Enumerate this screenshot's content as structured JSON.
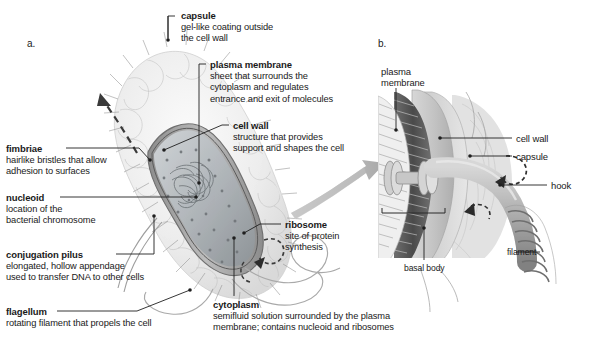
{
  "figure": {
    "panel_a_letter": "a.",
    "panel_b_letter": "b."
  },
  "panel_a": {
    "labels": [
      {
        "id": "capsule",
        "title": "capsule",
        "lines": [
          "gel-like coating outside",
          "the cell wall"
        ]
      },
      {
        "id": "plasma",
        "title": "plasma membrane",
        "lines": [
          "sheet that surrounds the",
          "cytoplasm and regulates",
          "entrance and exit of molecules"
        ]
      },
      {
        "id": "cellwall",
        "title": "cell wall",
        "lines": [
          "structure that provides",
          "support and shapes the cell"
        ]
      },
      {
        "id": "fimbriae",
        "title": "fimbriae",
        "lines": [
          "hairlike bristles that allow",
          "adhesion to surfaces"
        ]
      },
      {
        "id": "nucleoid",
        "title": "nucleoid",
        "lines": [
          "location of the",
          "bacterial chromosome"
        ]
      },
      {
        "id": "conjugation",
        "title": "conjugation pilus",
        "lines": [
          "elongated, hollow appendage",
          "used to transfer DNA to other cells"
        ]
      },
      {
        "id": "flagellum",
        "title": "flagellum",
        "lines": [
          "rotating filament that propels the cell"
        ]
      },
      {
        "id": "ribosome",
        "title": "ribosome",
        "lines": [
          "site of protein",
          "synthesis"
        ]
      },
      {
        "id": "cytoplasm",
        "title": "cytoplasm",
        "lines": [
          "semifluid solution surrounded by the plasma",
          "membrane; contains nucleoid and ribosomes"
        ]
      }
    ]
  },
  "panel_b": {
    "labels": [
      {
        "id": "b-plasma",
        "title": "plasma",
        "lines": [
          "membrane"
        ]
      },
      {
        "id": "b-cellwall",
        "title": "cell wall",
        "lines": []
      },
      {
        "id": "b-capsule",
        "title": "capsule",
        "lines": []
      },
      {
        "id": "b-hook",
        "title": "hook",
        "lines": []
      },
      {
        "id": "b-filament",
        "title": "filament",
        "lines": []
      },
      {
        "id": "b-basal",
        "title": "basal body",
        "lines": []
      }
    ]
  },
  "colors": {
    "text": "#1a1a1a",
    "leader_line": "#1f1f1f",
    "background": "#ffffff",
    "capsule_fill": "#e9e9e9",
    "cell_wall": "#9a9a9a",
    "cytoplasm": "#b9bdc0",
    "zoom_arrow": "#b2b2b2",
    "motion_arrow": "#3a3a3a"
  }
}
